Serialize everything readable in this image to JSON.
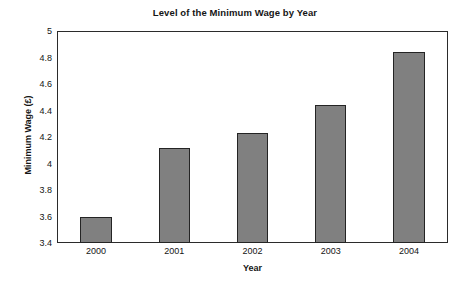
{
  "chart_data": {
    "type": "bar",
    "title": "Level of the Minimum Wage by Year",
    "xlabel": "Year",
    "ylabel": "Minimum Wage (£)",
    "categories": [
      "2000",
      "2001",
      "2002",
      "2003",
      "2004"
    ],
    "values": [
      3.6,
      4.12,
      4.23,
      4.44,
      4.84
    ],
    "ylim": [
      3.4,
      5
    ],
    "ytick_values": [
      3.4,
      3.6,
      3.8,
      4,
      4.2,
      4.4,
      4.6,
      4.8,
      5
    ],
    "ytick_labels": [
      "3.4",
      "3.6",
      "3.8",
      "4",
      "4.2",
      "4.4",
      "4.6",
      "4.8",
      "5"
    ],
    "grid": false,
    "legend": false,
    "legend_position": "none",
    "bar_color": "#808080",
    "bar_edge_color": "#242424",
    "frame_color": "#2b2b2b",
    "background_color": "#ffffff"
  }
}
